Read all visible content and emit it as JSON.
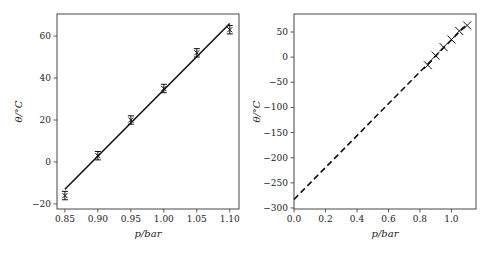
{
  "chart_data": [
    {
      "type": "scatter",
      "title": "",
      "xlabel": "p/bar",
      "ylabel": "θ/°C",
      "xlim": [
        0.838,
        1.114
      ],
      "ylim": [
        -22.4,
        70.5
      ],
      "grid": false,
      "xticks": [
        0.85,
        0.9,
        0.95,
        1.0,
        1.05,
        1.1
      ],
      "xtick_labels": [
        "0.85",
        "0.90",
        "0.95",
        "1.00",
        "1.05",
        "1.10"
      ],
      "yticks": [
        -20,
        0,
        20,
        40,
        60
      ],
      "ytick_labels": [
        "−20",
        "0",
        "20",
        "40",
        "60"
      ],
      "series": [
        {
          "name": "measurements",
          "marker": "x",
          "x": [
            0.85,
            0.9,
            0.95,
            1.0,
            1.05,
            1.1
          ],
          "y": [
            -16,
            3,
            20,
            35,
            52,
            63
          ],
          "yerr": [
            2,
            2,
            2,
            2,
            2,
            2
          ]
        },
        {
          "name": "linear fit",
          "style": "solid",
          "x": [
            0.85,
            1.1
          ],
          "y": [
            -13,
            66
          ]
        }
      ]
    },
    {
      "type": "line",
      "title": "",
      "xlabel": "p/bar",
      "ylabel": "θ/°C",
      "xlim": [
        0.0,
        1.156
      ],
      "ylim": [
        -302,
        85.8
      ],
      "grid": false,
      "xticks": [
        0.0,
        0.2,
        0.4,
        0.6,
        0.8,
        1.0
      ],
      "xtick_labels": [
        "0.0",
        "0.2",
        "0.4",
        "0.6",
        "0.8",
        "1.0"
      ],
      "yticks": [
        -300,
        -250,
        -200,
        -150,
        -100,
        -50,
        0,
        50
      ],
      "ytick_labels": [
        "−300",
        "−250",
        "−200",
        "−150",
        "−100",
        "−50",
        "0",
        "50"
      ],
      "series": [
        {
          "name": "measurements",
          "marker": "x",
          "x": [
            0.85,
            0.9,
            0.95,
            1.0,
            1.05,
            1.1
          ],
          "y": [
            -16,
            3,
            20,
            35,
            52,
            63
          ]
        },
        {
          "name": "extrapolated fit",
          "style": "dashed",
          "x": [
            0.0,
            1.1
          ],
          "y": [
            -283,
            66
          ]
        }
      ]
    }
  ]
}
